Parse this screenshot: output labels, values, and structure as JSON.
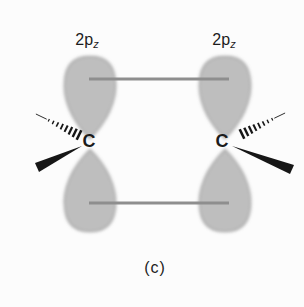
{
  "figure": {
    "caption": "(c)",
    "left_atom": {
      "symbol": "C"
    },
    "right_atom": {
      "symbol": "C"
    },
    "left_orbital_label": {
      "main": "2p",
      "sub": "z"
    },
    "right_orbital_label": {
      "main": "2p",
      "sub": "z"
    },
    "colors": {
      "lobe_base": "#c6c6c6",
      "lobe_dot": "#999999",
      "overlap_line": "#8e8e8e",
      "wedge": "#161616",
      "text": "#1c1c1c",
      "background": "#fcfcfc"
    }
  }
}
